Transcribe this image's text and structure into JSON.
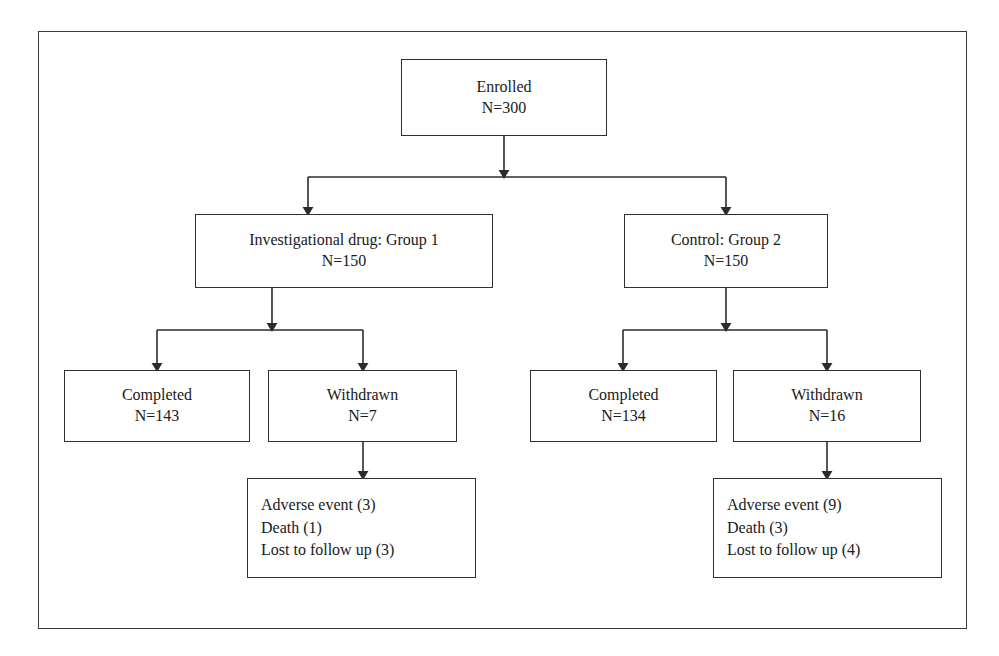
{
  "figure": {
    "type": "flowchart",
    "frame_color": "#3a3a3a",
    "box_border_color": "#2f2f2f",
    "connector_color": "#2b2b2b",
    "background": "#ffffff"
  },
  "nodes": {
    "enrolled": {
      "label": "Enrolled",
      "count_label": "N=300",
      "n": 300
    },
    "group1": {
      "label": "Investigational drug: Group 1",
      "count_label": "N=150",
      "n": 150
    },
    "group2": {
      "label": "Control: Group 2",
      "count_label": "N=150",
      "n": 150
    },
    "completed1": {
      "label": "Completed",
      "count_label": "N=143",
      "n": 143
    },
    "withdrawn1": {
      "label": "Withdrawn",
      "count_label": "N=7",
      "n": 7
    },
    "completed2": {
      "label": "Completed",
      "count_label": "N=134",
      "n": 134
    },
    "withdrawn2": {
      "label": "Withdrawn",
      "count_label": "N=16",
      "n": 16
    },
    "reasons1": {
      "line1": "Adverse event (3)",
      "line2": "Death (1)",
      "line3": "Lost to follow up (3)",
      "items": [
        {
          "reason": "Adverse event",
          "count": 3
        },
        {
          "reason": "Death",
          "count": 1
        },
        {
          "reason": "Lost to follow up",
          "count": 3
        }
      ]
    },
    "reasons2": {
      "line1": "Adverse event (9)",
      "line2": "Death (3)",
      "line3": "Lost to follow up (4)",
      "items": [
        {
          "reason": "Adverse event",
          "count": 9
        },
        {
          "reason": "Death",
          "count": 3
        },
        {
          "reason": "Lost to follow up",
          "count": 4
        }
      ]
    }
  },
  "edges": [
    {
      "from": "enrolled",
      "to": "group1"
    },
    {
      "from": "enrolled",
      "to": "group2"
    },
    {
      "from": "group1",
      "to": "completed1"
    },
    {
      "from": "group1",
      "to": "withdrawn1"
    },
    {
      "from": "group2",
      "to": "completed2"
    },
    {
      "from": "group2",
      "to": "withdrawn2"
    },
    {
      "from": "withdrawn1",
      "to": "reasons1"
    },
    {
      "from": "withdrawn2",
      "to": "reasons2"
    }
  ]
}
